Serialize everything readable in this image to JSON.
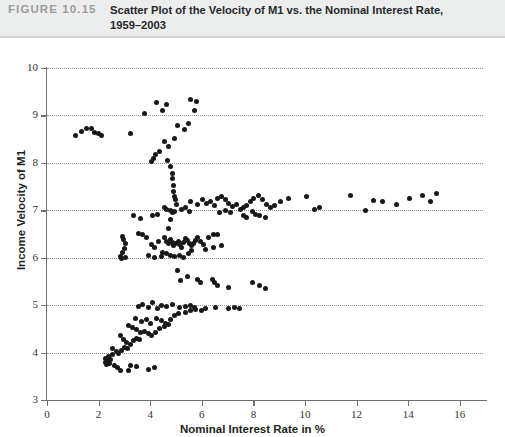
{
  "figure": {
    "label": "FIGURE 10.15",
    "title_line1": "Scatter Plot of the Velocity of M1 vs. the Nominal Interest Rate,",
    "title_line2": "1959–2003"
  },
  "chart_data": {
    "type": "scatter",
    "title": "Scatter Plot of the Velocity of M1 vs. the Nominal Interest Rate, 1959–2003",
    "xlabel": "Nominal Interest Rate in %",
    "ylabel": "Income Velocity of M1",
    "xlim": [
      0,
      16.9
    ],
    "ylim": [
      3,
      10
    ],
    "xticks": [
      0,
      2,
      4,
      6,
      8,
      10,
      12,
      14,
      16
    ],
    "yticks": [
      3,
      4,
      5,
      6,
      7,
      8,
      9,
      10
    ],
    "grid": "horizontal-dotted",
    "legend": null,
    "marker_color": "#16181a",
    "points": [
      [
        1.1,
        8.57
      ],
      [
        1.35,
        8.66
      ],
      [
        1.55,
        8.72
      ],
      [
        1.72,
        8.73
      ],
      [
        1.85,
        8.64
      ],
      [
        1.98,
        8.62
      ],
      [
        2.12,
        8.58
      ],
      [
        3.25,
        8.62
      ],
      [
        3.78,
        9.05
      ],
      [
        4.25,
        9.27
      ],
      [
        4.48,
        9.1
      ],
      [
        4.62,
        9.24
      ],
      [
        5.58,
        9.33
      ],
      [
        5.72,
        9.1
      ],
      [
        5.78,
        9.3
      ],
      [
        5.05,
        8.78
      ],
      [
        5.32,
        8.7
      ],
      [
        5.48,
        8.82
      ],
      [
        4.95,
        8.52
      ],
      [
        4.55,
        8.45
      ],
      [
        4.72,
        8.35
      ],
      [
        4.35,
        8.25
      ],
      [
        4.22,
        8.18
      ],
      [
        4.12,
        8.1
      ],
      [
        4.05,
        8.02
      ],
      [
        4.68,
        8.05
      ],
      [
        4.8,
        7.92
      ],
      [
        4.85,
        7.78
      ],
      [
        4.88,
        7.66
      ],
      [
        4.9,
        7.52
      ],
      [
        4.92,
        7.4
      ],
      [
        4.95,
        7.3
      ],
      [
        4.98,
        7.22
      ],
      [
        5.02,
        7.12
      ],
      [
        4.88,
        6.95
      ],
      [
        4.8,
        6.8
      ],
      [
        4.7,
        6.62
      ],
      [
        4.55,
        7.05
      ],
      [
        4.62,
        7.02
      ],
      [
        4.78,
        7.0
      ],
      [
        4.95,
        6.98
      ],
      [
        5.2,
        7.02
      ],
      [
        5.35,
        7.05
      ],
      [
        5.52,
        6.98
      ],
      [
        3.35,
        6.88
      ],
      [
        3.62,
        6.82
      ],
      [
        4.08,
        6.9
      ],
      [
        4.3,
        6.92
      ],
      [
        2.92,
        6.45
      ],
      [
        2.98,
        6.38
      ],
      [
        3.05,
        6.3
      ],
      [
        3.02,
        6.2
      ],
      [
        2.92,
        6.1
      ],
      [
        2.85,
        6.02
      ],
      [
        2.88,
        5.98
      ],
      [
        3.05,
        6.0
      ],
      [
        3.55,
        6.52
      ],
      [
        3.7,
        6.48
      ],
      [
        3.85,
        6.42
      ],
      [
        4.05,
        6.28
      ],
      [
        4.18,
        6.22
      ],
      [
        4.32,
        6.35
      ],
      [
        4.55,
        6.42
      ],
      [
        4.62,
        6.35
      ],
      [
        4.7,
        6.3
      ],
      [
        4.78,
        6.38
      ],
      [
        4.85,
        6.32
      ],
      [
        4.92,
        6.26
      ],
      [
        5.0,
        6.3
      ],
      [
        5.08,
        6.35
      ],
      [
        5.15,
        6.28
      ],
      [
        5.22,
        6.22
      ],
      [
        5.3,
        6.32
      ],
      [
        5.38,
        6.4
      ],
      [
        5.45,
        6.36
      ],
      [
        5.52,
        6.3
      ],
      [
        5.6,
        6.25
      ],
      [
        5.68,
        6.3
      ],
      [
        5.75,
        6.36
      ],
      [
        5.85,
        6.42
      ],
      [
        5.95,
        6.34
      ],
      [
        6.05,
        6.28
      ],
      [
        4.48,
        6.12
      ],
      [
        4.62,
        6.08
      ],
      [
        4.8,
        6.05
      ],
      [
        4.95,
        6.02
      ],
      [
        5.15,
        6.05
      ],
      [
        5.3,
        6.0
      ],
      [
        5.48,
        6.08
      ],
      [
        5.62,
        6.15
      ],
      [
        3.95,
        6.05
      ],
      [
        4.15,
        6.0
      ],
      [
        4.42,
        6.02
      ],
      [
        6.25,
        6.42
      ],
      [
        6.45,
        6.5
      ],
      [
        6.62,
        6.48
      ],
      [
        6.15,
        6.18
      ],
      [
        6.45,
        6.22
      ],
      [
        6.75,
        6.25
      ],
      [
        5.55,
        7.18
      ],
      [
        5.85,
        7.12
      ],
      [
        6.02,
        7.22
      ],
      [
        6.18,
        7.15
      ],
      [
        6.35,
        7.18
      ],
      [
        6.48,
        7.1
      ],
      [
        6.62,
        7.25
      ],
      [
        6.78,
        7.3
      ],
      [
        6.92,
        7.22
      ],
      [
        7.05,
        7.15
      ],
      [
        7.2,
        7.08
      ],
      [
        7.35,
        7.12
      ],
      [
        7.5,
        7.02
      ],
      [
        7.62,
        7.05
      ],
      [
        7.75,
        7.1
      ],
      [
        7.88,
        7.18
      ],
      [
        8.02,
        7.25
      ],
      [
        8.18,
        7.32
      ],
      [
        8.35,
        7.22
      ],
      [
        8.5,
        7.12
      ],
      [
        8.65,
        7.05
      ],
      [
        8.8,
        7.1
      ],
      [
        7.95,
        6.98
      ],
      [
        8.1,
        6.92
      ],
      [
        7.6,
        6.9
      ],
      [
        7.75,
        6.85
      ],
      [
        8.25,
        6.88
      ],
      [
        8.45,
        6.85
      ],
      [
        6.9,
        7.0
      ],
      [
        7.1,
        6.95
      ],
      [
        6.7,
        6.95
      ],
      [
        9.05,
        7.18
      ],
      [
        9.35,
        7.25
      ],
      [
        10.05,
        7.3
      ],
      [
        11.75,
        7.32
      ],
      [
        12.35,
        7.0
      ],
      [
        12.65,
        7.2
      ],
      [
        13.0,
        7.18
      ],
      [
        13.55,
        7.12
      ],
      [
        14.05,
        7.25
      ],
      [
        14.55,
        7.32
      ],
      [
        14.85,
        7.18
      ],
      [
        15.1,
        7.35
      ],
      [
        10.35,
        7.02
      ],
      [
        10.55,
        7.05
      ],
      [
        5.05,
        5.72
      ],
      [
        5.45,
        5.6
      ],
      [
        5.18,
        5.52
      ],
      [
        5.85,
        5.55
      ],
      [
        5.95,
        5.48
      ],
      [
        6.42,
        5.55
      ],
      [
        6.48,
        5.48
      ],
      [
        6.6,
        5.42
      ],
      [
        7.05,
        5.38
      ],
      [
        7.95,
        5.48
      ],
      [
        8.22,
        5.42
      ],
      [
        8.45,
        5.35
      ],
      [
        3.55,
        4.98
      ],
      [
        3.72,
        5.02
      ],
      [
        3.92,
        4.95
      ],
      [
        4.1,
        5.05
      ],
      [
        4.28,
        4.92
      ],
      [
        4.45,
        5.0
      ],
      [
        4.62,
        4.98
      ],
      [
        4.85,
        5.02
      ],
      [
        5.15,
        4.95
      ],
      [
        5.35,
        4.98
      ],
      [
        5.55,
        5.0
      ],
      [
        5.72,
        4.96
      ],
      [
        6.15,
        4.92
      ],
      [
        6.55,
        4.95
      ],
      [
        7.05,
        4.92
      ],
      [
        7.25,
        4.95
      ],
      [
        7.45,
        4.93
      ],
      [
        3.42,
        4.72
      ],
      [
        3.65,
        4.65
      ],
      [
        3.85,
        4.7
      ],
      [
        4.02,
        4.62
      ],
      [
        4.25,
        4.72
      ],
      [
        4.42,
        4.68
      ],
      [
        4.58,
        4.62
      ],
      [
        4.78,
        4.7
      ],
      [
        4.95,
        4.78
      ],
      [
        5.1,
        4.82
      ],
      [
        5.35,
        4.85
      ],
      [
        5.55,
        4.88
      ],
      [
        5.75,
        4.9
      ],
      [
        6.0,
        4.88
      ],
      [
        3.15,
        4.58
      ],
      [
        3.32,
        4.52
      ],
      [
        3.48,
        4.48
      ],
      [
        3.62,
        4.42
      ],
      [
        3.78,
        4.45
      ],
      [
        3.92,
        4.4
      ],
      [
        4.05,
        4.35
      ],
      [
        4.22,
        4.42
      ],
      [
        4.38,
        4.5
      ],
      [
        4.55,
        4.55
      ],
      [
        4.72,
        4.6
      ],
      [
        2.85,
        4.35
      ],
      [
        2.98,
        4.28
      ],
      [
        3.1,
        4.22
      ],
      [
        3.22,
        4.18
      ],
      [
        3.35,
        4.25
      ],
      [
        3.48,
        4.3
      ],
      [
        3.6,
        4.28
      ],
      [
        2.55,
        4.08
      ],
      [
        2.68,
        4.02
      ],
      [
        2.78,
        3.98
      ],
      [
        2.88,
        4.05
      ],
      [
        3.0,
        4.1
      ],
      [
        3.12,
        4.08
      ],
      [
        2.28,
        3.88
      ],
      [
        2.35,
        3.82
      ],
      [
        2.42,
        3.78
      ],
      [
        2.48,
        3.85
      ],
      [
        2.32,
        3.75
      ],
      [
        2.25,
        3.8
      ],
      [
        2.38,
        3.92
      ],
      [
        2.52,
        3.95
      ],
      [
        2.62,
        3.72
      ],
      [
        2.72,
        3.68
      ],
      [
        2.85,
        3.62
      ],
      [
        3.25,
        3.72
      ],
      [
        3.45,
        3.7
      ],
      [
        3.95,
        3.65
      ],
      [
        4.18,
        3.68
      ],
      [
        3.15,
        3.62
      ]
    ]
  }
}
